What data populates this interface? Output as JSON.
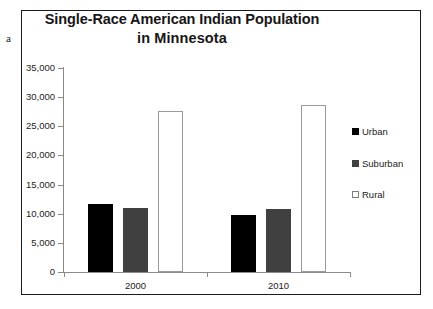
{
  "panel_label": "a",
  "chart_data": {
    "type": "bar",
    "title": "Single-Race American Indian Population in Minnesota",
    "title_lines": [
      "Single-Race American Indian Population",
      "in Minnesota"
    ],
    "xlabel": "",
    "ylabel": "",
    "categories": [
      "2000",
      "2010"
    ],
    "series": [
      {
        "name": "Urban",
        "color": "#000000",
        "values": [
          11600,
          9700
        ]
      },
      {
        "name": "Suburban",
        "color": "#404040",
        "values": [
          11000,
          10800
        ]
      },
      {
        "name": "Rural",
        "color": "#ffffff",
        "values": [
          27600,
          28700
        ]
      }
    ],
    "ylim": [
      0,
      35000
    ],
    "ytick_values": [
      35000,
      30000,
      25000,
      20000,
      15000,
      10000,
      5000,
      0
    ],
    "ytick_labels": [
      "35,000",
      "30,000",
      "25,000",
      "20,000",
      "15,000",
      "10,000",
      "5,000",
      "0"
    ],
    "grid": false,
    "legend_position": "right",
    "legend_entries": [
      "Urban",
      "Suburban",
      "Rural"
    ]
  },
  "style": {
    "frame_color": "#1b1b1b",
    "axis_color": "#8a8a8a",
    "text_color": "#222222",
    "background": "#ffffff"
  }
}
